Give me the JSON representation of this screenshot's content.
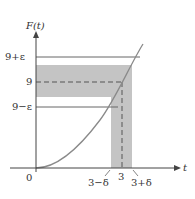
{
  "figure": {
    "y_axis_label": "F(t)",
    "x_axis_label": "t",
    "y_ticks": [
      "9+ε",
      "9",
      "9−ε"
    ],
    "x_ticks": [
      "3−δ",
      "3",
      "3+δ"
    ],
    "origin_label": "0",
    "colors": {
      "shade": "#bdbdbd",
      "line": "#555555",
      "curve": "#8a8a8a",
      "text": "#333333"
    }
  }
}
